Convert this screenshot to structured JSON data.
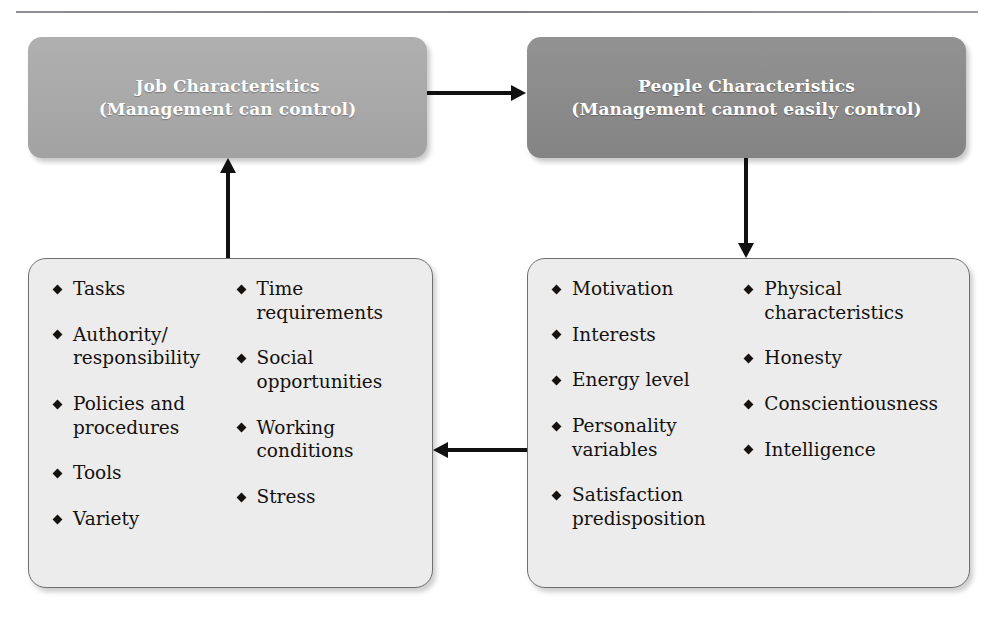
{
  "diagram": {
    "title_rule": "horizontal-rule",
    "header_boxes": [
      {
        "id": "job",
        "line1": "Job Characteristics",
        "line2": "(Management can control)",
        "fill": "#a9a9a9",
        "text_color": "#ffffff"
      },
      {
        "id": "people",
        "line1": "People Characteristics",
        "line2": "(Management cannot easily control)",
        "fill": "#8b8b8b",
        "text_color": "#ffffff"
      }
    ],
    "detail_boxes": [
      {
        "id": "job-items",
        "fill": "#ececec",
        "border": "#6f6f72",
        "column_1": [
          "Tasks",
          "Authority/ responsibility",
          "Policies and procedures",
          "Tools",
          "Variety"
        ],
        "column_2": [
          "Time requirements",
          "Social opportunities",
          "Working conditions",
          "Stress"
        ]
      },
      {
        "id": "people-items",
        "fill": "#ececec",
        "border": "#6f6f72",
        "column_1": [
          "Motivation",
          "Interests",
          "Energy level",
          "Personality variables",
          "Satisfaction predisposition"
        ],
        "column_2": [
          "Physical characteristics",
          "Honesty",
          "Conscientiousness",
          "Intelligence"
        ]
      }
    ],
    "arrows": [
      {
        "id": "job-to-people",
        "direction": "right"
      },
      {
        "id": "people-to-people-items",
        "direction": "down"
      },
      {
        "id": "people-items-to-job-items",
        "direction": "left"
      },
      {
        "id": "job-items-to-job",
        "direction": "up"
      }
    ]
  }
}
